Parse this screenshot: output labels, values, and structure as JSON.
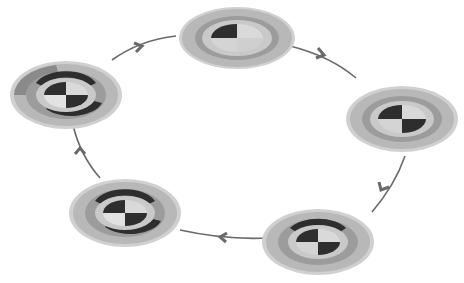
{
  "diagram": {
    "type": "cycle",
    "direction": "clockwise",
    "stage_count": 5,
    "colors": {
      "background": "#ffffff",
      "outer_ring": "#b8b8b8",
      "middle_ring": "#9c9c9c",
      "inner_ring": "#c9c9c9",
      "quadrant_dark": "#2e2e2e",
      "quadrant_light": "#d9d9d9",
      "quadrant_mid": "#8a8a8a",
      "arrow": "#6a6a6a"
    },
    "stages": [
      {
        "id": "stage-1",
        "position": "top-center",
        "highlighted_quadrant": "top-left"
      },
      {
        "id": "stage-2",
        "position": "right",
        "highlighted_quadrant": "top-left, bottom-right"
      },
      {
        "id": "stage-3",
        "position": "bottom-right",
        "highlighted_quadrant": "top-left, bottom-right"
      },
      {
        "id": "stage-4",
        "position": "bottom-left",
        "highlighted_quadrant": "top-left, bottom-right"
      },
      {
        "id": "stage-5",
        "position": "left",
        "highlighted_quadrant": "top-left, bottom-right"
      }
    ],
    "arrows": [
      {
        "from": "stage-1",
        "to": "stage-2"
      },
      {
        "from": "stage-2",
        "to": "stage-3"
      },
      {
        "from": "stage-3",
        "to": "stage-4"
      },
      {
        "from": "stage-4",
        "to": "stage-5"
      },
      {
        "from": "stage-5",
        "to": "stage-1"
      }
    ],
    "labels_note": "Disk labels are too small to be legible in the screenshot"
  }
}
